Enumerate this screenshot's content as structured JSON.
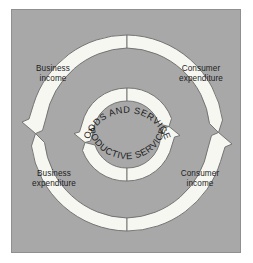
{
  "diagram": {
    "type": "circular-flow-economic-model",
    "panel": {
      "background_color": "#a8a8a8",
      "border_color": "#8f8f8f"
    },
    "rings": {
      "outer": {
        "name": "outer-flow-ring",
        "fill_color": "#f7f7f2",
        "stroke_color": "#6b6b6b",
        "center_x": 127,
        "center_y": 133,
        "radius": 92,
        "band_thickness": 13,
        "arrow_direction_left": "down",
        "arrow_direction_right": "up"
      },
      "inner": {
        "name": "inner-flow-ring",
        "fill_color": "#f7f7f2",
        "stroke_color": "#6b6b6b",
        "center_x": 127,
        "center_y": 134,
        "radius": 39,
        "band_thickness": 13,
        "arrow_direction_left": "down",
        "arrow_direction_right": "up"
      }
    },
    "labels": {
      "business_income": "Business\nincome",
      "business_income_line1": "Business",
      "business_income_line2": "income",
      "consumer_expenditure_line1": "Consumer",
      "consumer_expenditure_line2": "expenditure",
      "business_expenditure_line1": "Business",
      "business_expenditure_line2": "expenditure",
      "consumer_income_line1": "Consumer",
      "consumer_income_line2": "income"
    },
    "arc_labels": {
      "top": "GOODS AND SERVICES",
      "bottom": "PRODUCTIVE SERVICES"
    },
    "text_color": "#1d1d1d"
  }
}
